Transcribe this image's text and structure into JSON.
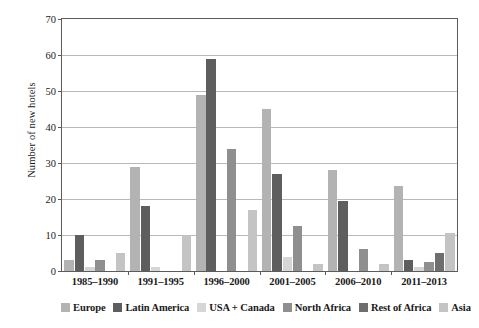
{
  "chart_data": {
    "type": "bar",
    "title": "",
    "xlabel": "",
    "ylabel": "Number of new hotels",
    "ylim": [
      0,
      70
    ],
    "yticks": [
      0,
      10,
      20,
      30,
      40,
      50,
      60,
      70
    ],
    "grid": "horizontal",
    "legend_position": "bottom",
    "categories": [
      "1985–1990",
      "1991–1995",
      "1996–2000",
      "2001–2005",
      "2006–2010",
      "2011–2013"
    ],
    "series": [
      {
        "name": "Europe",
        "color": "#b3b3b3",
        "values": [
          3,
          29,
          49,
          45,
          28,
          23.5
        ]
      },
      {
        "name": "Latin America",
        "color": "#5e5e5e",
        "values": [
          10,
          18,
          59,
          27,
          19.5,
          3
        ]
      },
      {
        "name": "USA + Canada",
        "color": "#d6d6d6",
        "values": [
          1,
          1,
          0,
          4,
          0,
          1
        ]
      },
      {
        "name": "North Africa",
        "color": "#8f8f8f",
        "values": [
          3,
          0,
          34,
          12.5,
          6,
          2.5
        ]
      },
      {
        "name": "Rest of Africa",
        "color": "#6e6e6e",
        "values": [
          0,
          0,
          0,
          0,
          0,
          5
        ]
      },
      {
        "name": "Asia",
        "color": "#c4c4c4",
        "values": [
          5,
          10,
          17,
          2,
          2,
          10.5
        ]
      }
    ]
  },
  "axis": {
    "y_title": "Number of new hotels",
    "tick_labels": [
      "0",
      "10",
      "20",
      "30",
      "40",
      "50",
      "60",
      "70"
    ]
  },
  "legend": {
    "items": [
      {
        "label": "Europe",
        "swatch": "legend-swatch-europe"
      },
      {
        "label": "Latin America",
        "swatch": "legend-swatch-latin-america"
      },
      {
        "label": "USA + Canada",
        "swatch": "legend-swatch-usa-canada"
      },
      {
        "label": "North Africa",
        "swatch": "legend-swatch-north-africa"
      },
      {
        "label": "Rest of Africa",
        "swatch": "legend-swatch-rest-of-africa"
      },
      {
        "label": "Asia",
        "swatch": "legend-swatch-asia"
      }
    ]
  }
}
